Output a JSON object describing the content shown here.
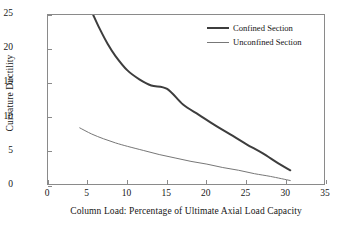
{
  "chart_data": {
    "type": "line",
    "title": "",
    "xlabel": "Column Load: Percentage of Ultimate Axial Load Capacity",
    "ylabel": "Curvature Ductility",
    "xlim": [
      0,
      35
    ],
    "ylim": [
      0,
      25
    ],
    "xticks": [
      0,
      5,
      10,
      15,
      20,
      25,
      30,
      35
    ],
    "yticks": [
      0,
      5,
      10,
      15,
      20,
      25
    ],
    "grid": false,
    "legend_position": "upper-right-inside",
    "series": [
      {
        "name": "Confined Section",
        "color": "#3d3d3d",
        "line_width": 2,
        "x": [
          5.7,
          6.5,
          7.5,
          8.5,
          10.0,
          11.5,
          13.0,
          15.0,
          17.0,
          19.0,
          21.0,
          23.0,
          25.0,
          27.0,
          29.0,
          30.5
        ],
        "y": [
          25.0,
          23.0,
          20.8,
          19.0,
          16.9,
          15.6,
          14.7,
          14.2,
          11.9,
          10.4,
          8.9,
          7.5,
          6.1,
          4.8,
          3.3,
          2.3
        ]
      },
      {
        "name": "Unconfined Section",
        "color": "#777777",
        "line_width": 1,
        "x": [
          4.0,
          5.5,
          7.0,
          8.5,
          10.0,
          12.0,
          14.0,
          16.0,
          18.0,
          20.0,
          22.0,
          24.0,
          26.0,
          28.0,
          30.5
        ],
        "y": [
          8.5,
          7.6,
          6.9,
          6.3,
          5.8,
          5.2,
          4.6,
          4.1,
          3.6,
          3.2,
          2.7,
          2.3,
          1.8,
          1.4,
          0.8
        ]
      }
    ]
  }
}
